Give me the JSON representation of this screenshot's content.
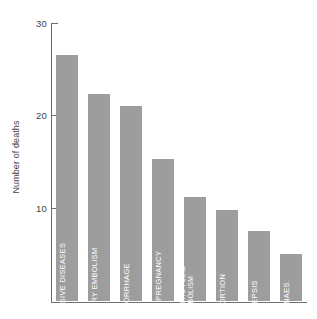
{
  "chart_data": {
    "type": "bar",
    "title": "",
    "subtitle": "",
    "xlabel": "",
    "ylabel": "Number of deaths",
    "ylim": [
      0,
      30
    ],
    "yticks": [
      10,
      20,
      30
    ],
    "ytick_labels": [
      "10",
      "20",
      "30"
    ],
    "grid": false,
    "legend": false,
    "bar_color": "#9d9d9d",
    "axis_color": "#6e6e6e",
    "background": "#ffffff",
    "categories": [
      "HYPERTENSIVE DISEASES",
      "PULMONARY EMBOLISM",
      "HAEMORRHAGE",
      "ECTOPIC PREGNANCY",
      "AMNIOTIC FLUID EMBOLISM",
      "ABORTION",
      "SEPSIS",
      "ANAES."
    ],
    "values": [
      26.5,
      22.3,
      21,
      15.3,
      11.2,
      9.8,
      7.5,
      5
    ],
    "bars": [
      {
        "label": "HYPERTENSIVE DISEASES",
        "label_lines": [
          "HYPERTENSIVE DISEASES"
        ],
        "value": 26.5
      },
      {
        "label": "PULMONARY EMBOLISM",
        "label_lines": [
          "PULMONARY EMBOLISM"
        ],
        "value": 22.3
      },
      {
        "label": "HAEMORRHAGE",
        "label_lines": [
          "HAEMORRHAGE"
        ],
        "value": 21
      },
      {
        "label": "ECTOPIC PREGNANCY",
        "label_lines": [
          "ECTOPIC PREGNANCY"
        ],
        "value": 15.3
      },
      {
        "label": "AMNIOTIC FLUID EMBOLISM",
        "label_lines": [
          "AMNIOTIC FLUID",
          "EMBOLISM"
        ],
        "value": 11.2
      },
      {
        "label": "ABORTION",
        "label_lines": [
          "ABORTION"
        ],
        "value": 9.8
      },
      {
        "label": "SEPSIS",
        "label_lines": [
          "SEPSIS"
        ],
        "value": 7.5
      },
      {
        "label": "ANAES.",
        "label_lines": [
          "ANAES."
        ],
        "value": 5
      }
    ]
  }
}
